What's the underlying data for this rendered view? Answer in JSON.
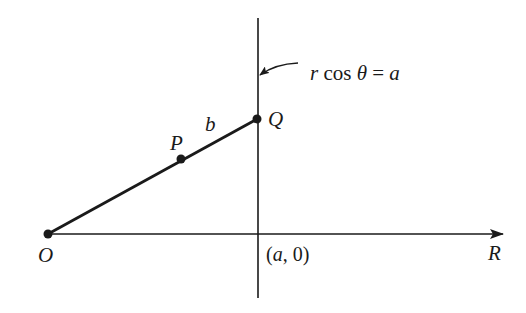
{
  "diagram": {
    "type": "geometry-figure",
    "labels": {
      "origin": "O",
      "point_p": "P",
      "point_q": "Q",
      "segment_b": "b",
      "x_axis": "R",
      "intercept_open": "(",
      "intercept_a": "a",
      "intercept_rest": ", 0)",
      "line_eq_r": "r",
      "line_eq_cos": " cos ",
      "line_eq_theta": "θ",
      "line_eq_equals": " = ",
      "line_eq_a": "a"
    },
    "points": {
      "O": [
        48,
        234
      ],
      "P": [
        181,
        159
      ],
      "Q": [
        257,
        119
      ]
    },
    "lines": {
      "horizontal_axis": {
        "from": [
          48,
          234
        ],
        "to": [
          503,
          234
        ],
        "arrow": true
      },
      "vertical_line": {
        "x": 258,
        "from_y": 18,
        "to_y": 298
      },
      "segment_OQ": {
        "from": [
          48,
          234
        ],
        "to": [
          257,
          119
        ]
      }
    },
    "colors": {
      "stroke": "#1a1a1a",
      "background": "#ffffff"
    }
  }
}
